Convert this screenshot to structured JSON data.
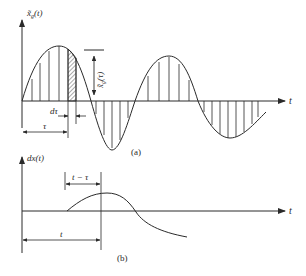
{
  "figure_a": {
    "y_axis_label": "x̃",
    "y_axis_sub": "g",
    "y_axis_arg": "(t)",
    "x_axis_label": "t",
    "amplitude_label": "x̃",
    "amplitude_sub": "g",
    "amplitude_arg": "(τ)",
    "dtau_label": "dτ",
    "tau_label": "τ",
    "caption": "(a)"
  },
  "figure_b": {
    "y_axis_label": "dx(t)",
    "x_axis_label": "t",
    "delay_label": "t − τ",
    "t_label": "t",
    "caption": "(b)"
  },
  "colors": {
    "ink": "#2a2a2a",
    "background": "#ffffff"
  }
}
